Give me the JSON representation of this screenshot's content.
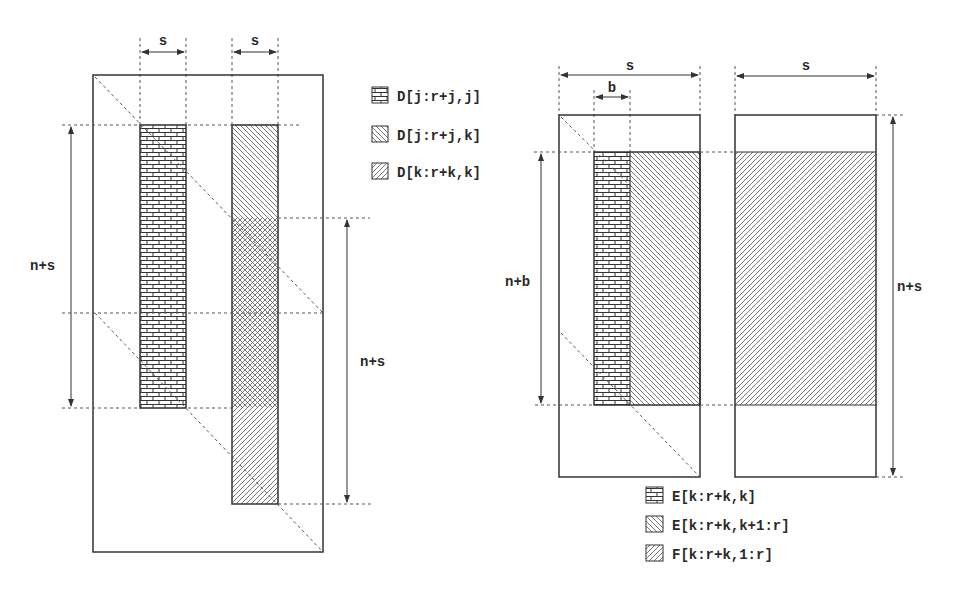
{
  "figure": {
    "left_panel": {
      "dimension_labels": {
        "col1_width": "s",
        "col2_width": "s",
        "left_height": "n+s",
        "right_height": "n+s"
      },
      "legend": [
        {
          "pattern": "brick",
          "label": "D[j:r+j,j]"
        },
        {
          "pattern": "hatch-back",
          "label": "D[j:r+j,k]"
        },
        {
          "pattern": "hatch-forward",
          "label": "D[k:r+k,k]"
        }
      ]
    },
    "right_panel": {
      "dimension_labels": {
        "block_width": "s",
        "inner_width": "b",
        "second_block_width": "s",
        "left_height": "n+b",
        "right_height": "n+s"
      },
      "legend": [
        {
          "pattern": "brick",
          "label": "E[k:r+k,k]"
        },
        {
          "pattern": "hatch-back",
          "label": "E[k:r+k,k+1:r]"
        },
        {
          "pattern": "hatch-forward",
          "label": "F[k:r+k,1:r]"
        }
      ]
    },
    "colors": {
      "line": "#333333",
      "dash": "#555555",
      "background": "#ffffff"
    }
  }
}
